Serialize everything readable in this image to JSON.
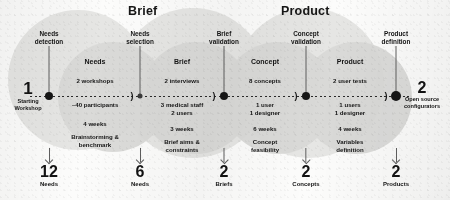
{
  "diagram": {
    "title_phases": [
      {
        "label": "Brief",
        "x": 150
      },
      {
        "label": "Product",
        "x": 300
      }
    ],
    "start": {
      "number": "1",
      "caption_line1": "Starting",
      "caption_line2": "Workshop"
    },
    "milestones": [
      {
        "name": "needs-detection",
        "line1": "Needs",
        "line2": "detection"
      },
      {
        "name": "needs-selection",
        "line1": "Needs",
        "line2": "selection"
      },
      {
        "name": "brief-validation",
        "line1": "Brief",
        "line2": "validation"
      },
      {
        "name": "concept-validation",
        "line1": "Concept",
        "line2": "validation"
      },
      {
        "name": "product-definition",
        "line1": "Product",
        "line2": "definition"
      }
    ],
    "steps": [
      {
        "name": "needs",
        "phase": "Needs",
        "above_line1": "2 workshops",
        "above_line2": "~40 participants",
        "duration": "4 weeks",
        "outcome_line1": "Brainstorming &",
        "outcome_line2": "benchmark"
      },
      {
        "name": "brief",
        "phase": "Brief",
        "above_line1": "2 interviews",
        "above_line2": "3 medical staff",
        "above_line3": "2 users",
        "duration": "3 weeks",
        "outcome_line1": "Brief aims &",
        "outcome_line2": "constraints"
      },
      {
        "name": "concept",
        "phase": "Concept",
        "above_line1": "8 concepts",
        "above_line2": "1 user",
        "above_line3": "1 designer",
        "duration": "6 weeks",
        "outcome_line1": "Concept",
        "outcome_line2": "feasibility"
      },
      {
        "name": "product",
        "phase": "Product",
        "above_line1": "2 user tests",
        "above_line2": "1 users",
        "above_line3": "1 designer",
        "duration": "4 weeks",
        "outcome_line1": "Variables",
        "outcome_line2": "definition"
      }
    ],
    "deliverables": [
      {
        "name": "needs",
        "number": "12",
        "caption": "Needs"
      },
      {
        "name": "needs-2",
        "number": "6",
        "caption": "Needs"
      },
      {
        "name": "briefs",
        "number": "2",
        "caption": "Briefs"
      },
      {
        "name": "concepts",
        "number": "2",
        "caption": "Concepts"
      },
      {
        "name": "products",
        "number": "2",
        "caption": "Products"
      }
    ],
    "final": {
      "number": "2",
      "caption_line1": "Open source",
      "caption_line2": "configurators"
    },
    "colors": {
      "background": "#fcfcfb",
      "circle": "#d9d9d7",
      "circle_soft": "#e4e4e2",
      "ink": "#161616",
      "stem": "#5f5f5f"
    }
  }
}
